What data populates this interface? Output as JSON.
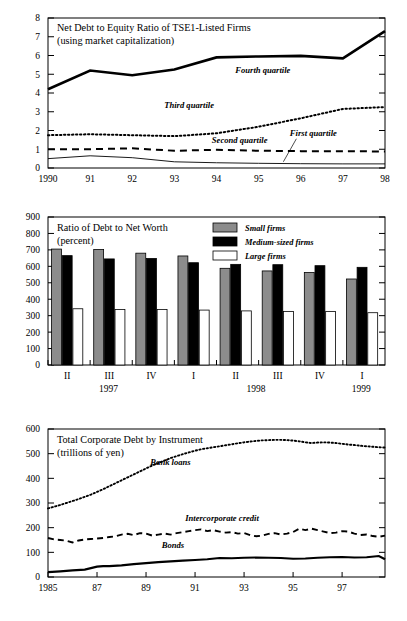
{
  "page": {
    "background": "#ffffff"
  },
  "chart_data": [
    {
      "id": "net-debt-to-equity",
      "type": "line",
      "title": "Net Debt to Equity Ratio of  TSE1-Listed Firms",
      "subtitle": "(using market capitalization)",
      "xlabel": "",
      "ylabel": "",
      "ylim": [
        0,
        8
      ],
      "yticks": [
        0,
        1,
        2,
        3,
        4,
        5,
        6,
        7,
        8
      ],
      "xticklabels": [
        "1990",
        "91",
        "92",
        "93",
        "94",
        "95",
        "96",
        "97",
        "98"
      ],
      "x": [
        1990,
        1991,
        1992,
        1993,
        1994,
        1995,
        1996,
        1997,
        1998
      ],
      "grid": false,
      "legend_position": "inline-annotations",
      "series": [
        {
          "name": "Fourth quartile",
          "style": "solid-thick",
          "color": "#000000",
          "label_x": 1995.1,
          "label_y": 5.05,
          "values": [
            4.2,
            5.2,
            4.95,
            5.25,
            5.9,
            5.95,
            5.98,
            5.85,
            7.3
          ]
        },
        {
          "name": "Third quartile",
          "style": "dotted",
          "color": "#000000",
          "label_x": 1993.35,
          "label_y": 3.18,
          "values": [
            1.75,
            1.8,
            1.75,
            1.7,
            1.85,
            2.2,
            2.65,
            3.15,
            3.25
          ]
        },
        {
          "name": "Second quartile",
          "style": "dashed",
          "color": "#000000",
          "label_x": 1994.55,
          "label_y": 1.35,
          "values": [
            1.0,
            1.0,
            1.05,
            0.92,
            0.97,
            0.92,
            0.9,
            0.9,
            0.88
          ]
        },
        {
          "name": "First quartile",
          "style": "solid-thin",
          "color": "#000000",
          "label_x": 1996.3,
          "label_y": 1.72,
          "leader": true,
          "values": [
            0.5,
            0.65,
            0.55,
            0.33,
            0.28,
            0.25,
            0.23,
            0.22,
            0.22
          ]
        }
      ]
    },
    {
      "id": "debt-to-net-worth",
      "type": "bar",
      "title": "Ratio of Debt to Net Worth",
      "subtitle": "(percent)",
      "xlabel": "",
      "ylabel": "",
      "ylim": [
        0,
        900
      ],
      "yticks": [
        0,
        100,
        200,
        300,
        400,
        500,
        600,
        700,
        800,
        900
      ],
      "categories": [
        "II",
        "III",
        "IV",
        "I",
        "II",
        "III",
        "IV",
        "I"
      ],
      "year_labels": [
        {
          "text": "1997",
          "category_index": 1
        },
        {
          "text": "1998",
          "category_index": 4.5
        },
        {
          "text": "1999",
          "category_index": 7
        }
      ],
      "grid": false,
      "legend_position": "top-right",
      "series": [
        {
          "name": "Small firms",
          "color": "#8c8c8c",
          "values": [
            705,
            702,
            680,
            663,
            588,
            572,
            562,
            523
          ]
        },
        {
          "name": "Medium-sized firms",
          "color": "#000000",
          "values": [
            665,
            645,
            648,
            622,
            612,
            610,
            604,
            594
          ]
        },
        {
          "name": "Large firms",
          "color": "#ffffff",
          "values": [
            342,
            337,
            338,
            334,
            329,
            326,
            326,
            318
          ]
        }
      ]
    },
    {
      "id": "total-corporate-debt",
      "type": "line",
      "title": "Total Corporate Debt by Instrument",
      "subtitle": "(trillions of yen)",
      "xlabel": "",
      "ylabel": "",
      "ylim": [
        0,
        600
      ],
      "yticks": [
        0,
        100,
        200,
        300,
        400,
        500,
        600
      ],
      "xticklabels": [
        "1985",
        "87",
        "89",
        "91",
        "93",
        "95",
        "97"
      ],
      "xtickvalues": [
        1985,
        1987,
        1989,
        1991,
        1993,
        1995,
        1997
      ],
      "xlim": [
        1985,
        1998.75
      ],
      "grid": false,
      "legend_position": "inline-annotations",
      "series": [
        {
          "name": "Bank loans",
          "style": "dotted",
          "color": "#000000",
          "label_x": 1990.0,
          "label_y": 455,
          "x": [
            1985,
            1985.25,
            1985.5,
            1985.75,
            1986,
            1986.25,
            1986.5,
            1986.75,
            1987,
            1987.25,
            1987.5,
            1987.75,
            1988,
            1988.25,
            1988.5,
            1988.75,
            1989,
            1989.25,
            1989.5,
            1989.75,
            1990,
            1990.25,
            1990.5,
            1990.75,
            1991,
            1991.25,
            1991.5,
            1991.75,
            1992,
            1992.25,
            1992.5,
            1992.75,
            1993,
            1993.25,
            1993.5,
            1993.75,
            1994,
            1994.25,
            1994.5,
            1994.75,
            1995,
            1995.25,
            1995.5,
            1995.75,
            1996,
            1996.25,
            1996.5,
            1996.75,
            1997,
            1997.25,
            1997.5,
            1997.75,
            1998,
            1998.25,
            1998.5,
            1998.75
          ],
          "values": [
            278,
            285,
            292,
            300,
            308,
            316,
            325,
            334,
            345,
            356,
            368,
            380,
            392,
            404,
            416,
            428,
            440,
            452,
            462,
            472,
            482,
            490,
            498,
            505,
            512,
            518,
            522,
            526,
            530,
            534,
            538,
            542,
            546,
            549,
            552,
            554,
            555,
            556,
            556,
            555,
            553,
            550,
            546,
            543,
            545,
            546,
            545,
            543,
            540,
            537,
            535,
            532,
            530,
            528,
            526,
            525
          ]
        },
        {
          "name": "Intercorporate credit",
          "style": "dashed",
          "color": "#000000",
          "label_x": 1992.1,
          "label_y": 228,
          "x": [
            1985,
            1985.25,
            1985.5,
            1985.75,
            1986,
            1986.25,
            1986.5,
            1986.75,
            1987,
            1987.25,
            1987.5,
            1987.75,
            1988,
            1988.25,
            1988.5,
            1988.75,
            1989,
            1989.25,
            1989.5,
            1989.75,
            1990,
            1990.25,
            1990.5,
            1990.75,
            1991,
            1991.25,
            1991.5,
            1991.75,
            1992,
            1992.25,
            1992.5,
            1992.75,
            1993,
            1993.25,
            1993.5,
            1993.75,
            1994,
            1994.25,
            1994.5,
            1994.75,
            1995,
            1995.25,
            1995.5,
            1995.75,
            1996,
            1996.25,
            1996.5,
            1996.75,
            1997,
            1997.25,
            1997.5,
            1997.75,
            1998,
            1998.25,
            1998.5,
            1998.75
          ],
          "values": [
            158,
            152,
            150,
            147,
            140,
            148,
            152,
            154,
            156,
            158,
            162,
            165,
            172,
            175,
            170,
            178,
            176,
            168,
            172,
            176,
            172,
            178,
            182,
            186,
            190,
            193,
            186,
            190,
            184,
            180,
            182,
            176,
            178,
            170,
            165,
            168,
            175,
            178,
            172,
            176,
            182,
            196,
            190,
            196,
            190,
            184,
            178,
            180,
            186,
            184,
            176,
            170,
            172,
            166,
            163,
            168
          ]
        },
        {
          "name": "Bonds",
          "style": "solid-thick",
          "color": "#000000",
          "label_x": 1990.1,
          "label_y": 118,
          "x": [
            1985,
            1985.5,
            1986,
            1986.5,
            1987,
            1987.25,
            1987.5,
            1988,
            1988.5,
            1989,
            1989.5,
            1990,
            1990.5,
            1991,
            1991.5,
            1992,
            1992.5,
            1993,
            1993.5,
            1994,
            1994.5,
            1995,
            1995.5,
            1996,
            1996.5,
            1997,
            1997.5,
            1998,
            1998.5,
            1998.75
          ],
          "values": [
            20,
            23,
            27,
            30,
            42,
            44,
            44,
            47,
            52,
            56,
            60,
            63,
            66,
            69,
            72,
            77,
            76,
            78,
            79,
            78,
            77,
            74,
            75,
            78,
            80,
            81,
            79,
            80,
            85,
            72
          ]
        }
      ]
    }
  ]
}
